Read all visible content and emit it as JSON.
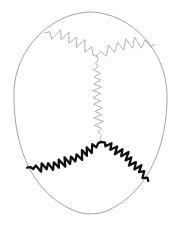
{
  "figure": {
    "name": "skull-superior-view",
    "background_color": "#ffffff",
    "width": 181,
    "height": 230
  },
  "colors": {
    "background": "#ffffff",
    "outline_stroke": "#9a9a9a",
    "faint_suture_stroke": "#a0a0a0",
    "bold_suture_stroke": "#111111"
  },
  "strokes": {
    "outline_width": 0.9,
    "faint_suture_width": 0.8,
    "bold_suture_width": 2.3
  },
  "chart_data": {
    "type": "diagram",
    "elements": [
      {
        "id": "cranial-outline",
        "label": "Cranial vault outline",
        "style": "faint",
        "closed": true,
        "bbox": [
          14,
          12,
          167,
          214
        ]
      },
      {
        "id": "coronal-suture-left",
        "label": "Coronal suture (left half)",
        "style": "faint",
        "from": [
          45,
          33
        ],
        "to": [
          97,
          56
        ],
        "serration": "wavy-loops",
        "amplitude": 5.5,
        "wavelength": 9
      },
      {
        "id": "coronal-suture-right",
        "label": "Coronal suture (right half)",
        "style": "faint",
        "from": [
          97,
          56
        ],
        "to": [
          155,
          45
        ],
        "serration": "wavy-loops",
        "amplitude": 5.5,
        "wavelength": 9
      },
      {
        "id": "sagittal-suture",
        "label": "Sagittal suture",
        "style": "faint",
        "from": [
          97,
          56
        ],
        "to": [
          101,
          142
        ],
        "serration": "tight-zigzag",
        "amplitude": 4,
        "wavelength": 7
      },
      {
        "id": "lambdoid-suture-left",
        "label": "Lambdoid suture (left limb)",
        "style": "bold",
        "from": [
          27,
          168
        ],
        "to": [
          101,
          142
        ],
        "serration": "dense-zigzag",
        "amplitude": 4,
        "wavelength": 6
      },
      {
        "id": "lambdoid-suture-right",
        "label": "Lambdoid suture (right limb)",
        "style": "bold",
        "from": [
          101,
          142
        ],
        "to": [
          148,
          181
        ],
        "serration": "dense-zigzag",
        "amplitude": 4,
        "wavelength": 6
      }
    ],
    "landmarks": [
      {
        "id": "bregma",
        "label": "Bregma",
        "x": 97,
        "y": 56
      },
      {
        "id": "lambda",
        "label": "Lambda",
        "x": 101,
        "y": 142
      }
    ],
    "bones": [
      {
        "id": "frontal-bone",
        "label": "Frontal bone"
      },
      {
        "id": "parietal-bone-left",
        "label": "Left parietal bone"
      },
      {
        "id": "parietal-bone-right",
        "label": "Right parietal bone"
      },
      {
        "id": "occipital-bone",
        "label": "Occipital bone"
      }
    ],
    "labels": [],
    "annotations": []
  }
}
